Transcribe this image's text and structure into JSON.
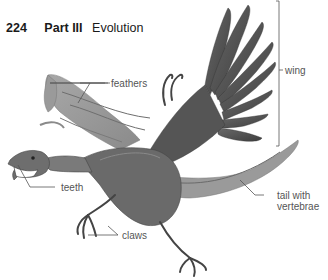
{
  "header": {
    "page_number": "224",
    "part": "Part III",
    "chapter": "Evolution"
  },
  "figure": {
    "labels": {
      "feathers": "feathers",
      "wing": "wing",
      "teeth": "teeth",
      "claws": "claws",
      "tail_line1": "tail with",
      "tail_line2": "vertebrae"
    },
    "colors": {
      "label_text": "#555555",
      "leader_line": "#555555",
      "header_text": "#1a1a1a"
    }
  }
}
